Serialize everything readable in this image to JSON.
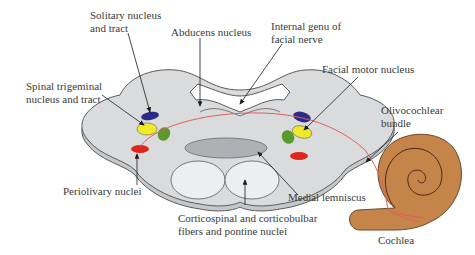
{
  "diagram": {
    "labels": {
      "solitary": [
        "Solitary nucleus",
        "and tract"
      ],
      "abducens": "Abducens nucleus",
      "internal_genu": [
        "Internal genu of",
        "facial nerve"
      ],
      "facial_motor": "Facial motor nucleus",
      "spinal_trigeminal": [
        "Spinal trigeminal",
        "nucleus and tract"
      ],
      "olivocochlear": [
        "Olivocochlear",
        "bundle"
      ],
      "periolivary": "Periolivary nuclei",
      "medial_lemniscus": "Medial lemniscus",
      "corticospinal": [
        "Corticospinal and corticobulbar",
        "fibers and pontine nuclei"
      ],
      "cochlea": "Cochlea"
    },
    "colors": {
      "pons_fill": "#d9dbdd",
      "pons_edge": "#5a5a5a",
      "solitary": "#2b2b8a",
      "trigeminal": "#f0e82a",
      "facial_motor_green": "#5a9a2a",
      "periolivary": "#e0251a",
      "lemniscus": "#aeb1b4",
      "corticospinal": "#eceef0",
      "cochlea": "#c4844a",
      "bundle": "#e0605a"
    }
  }
}
